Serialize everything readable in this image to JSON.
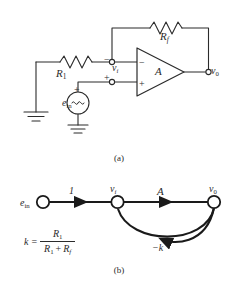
{
  "figure": {
    "stroke_color": "#2b2b2b",
    "background": "#ffffff",
    "captions": {
      "a": "(a)",
      "b": "(b)"
    }
  },
  "circuit": {
    "name": "inverting-operational-amplifier",
    "resistor_input_label": "R",
    "resistor_input_sub": "1",
    "resistor_feedback_label": "R",
    "resistor_feedback_sub": "f",
    "node_vi_label": "v",
    "node_vi_sub": "i",
    "node_v0_label": "v",
    "node_v0_sub": "0",
    "amp_gain_label": "A",
    "source_label": "e",
    "source_sub": "in",
    "source_symbol": "∿",
    "sign_minus": "−",
    "sign_plus": "+",
    "ground_symbol": "earth-ground"
  },
  "flow_graph": {
    "name": "signal-flow-graph",
    "nodes": [
      {
        "id": "ein",
        "label": "e",
        "sub": "in"
      },
      {
        "id": "vi",
        "label": "v",
        "sub": "i"
      },
      {
        "id": "v0",
        "label": "v",
        "sub": "0"
      }
    ],
    "branches": [
      {
        "from": "ein",
        "to": "vi",
        "gain": "1"
      },
      {
        "from": "vi",
        "to": "v0",
        "gain": "A"
      },
      {
        "from": "v0",
        "to": "vi",
        "gain": "−k"
      }
    ],
    "formula": {
      "lhs": "k",
      "equals": "=",
      "numerator": "R",
      "numerator_sub": "1",
      "denominator_first": "R",
      "denominator_first_sub": "1",
      "denominator_plus": "+",
      "denominator_second": "R",
      "denominator_second_sub": "f"
    }
  }
}
